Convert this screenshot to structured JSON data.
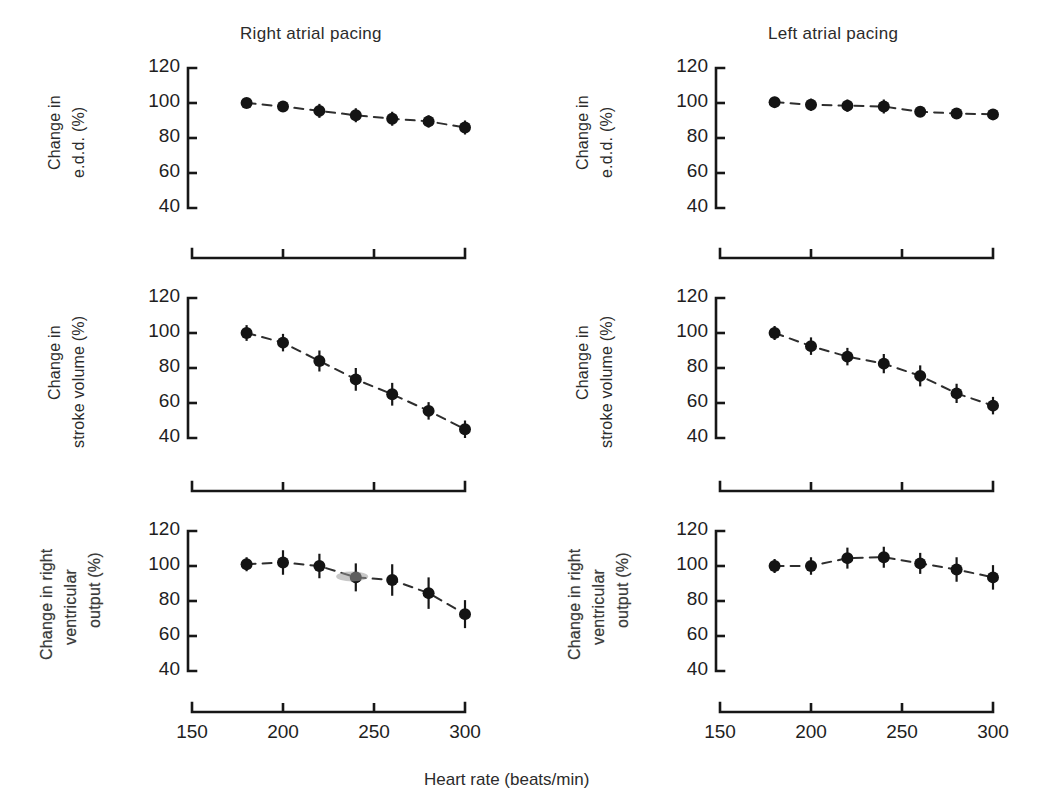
{
  "figure": {
    "column_titles": [
      "Right atrial pacing",
      "Left atrial pacing"
    ],
    "x_axis_caption": "Heart rate (beats/min)",
    "x_tick_labels": [
      "150",
      "200",
      "250",
      "300"
    ],
    "y_tick_labels": [
      "120",
      "100",
      "80",
      "60",
      "40"
    ],
    "row_y_labels": [
      [
        "Change in",
        "e.d.d. (%)"
      ],
      [
        "Change in",
        "stroke volume (%)"
      ],
      [
        "Change in right",
        "ventricular",
        "output (%)"
      ]
    ],
    "colors": {
      "ink": "#171717",
      "marker": "#141414",
      "line": "#2e2e2e",
      "text": "#2b2b2b",
      "background": "#ffffff"
    }
  },
  "chart_data": [
    {
      "type": "scatter",
      "title": "Right atrial pacing",
      "subplot": "row1-left",
      "xlabel": "Heart rate (beats/min)",
      "ylabel": "Change in e.d.d. (%)",
      "xlim": [
        150,
        300
      ],
      "ylim": [
        40,
        120
      ],
      "xticks": [
        150,
        200,
        250,
        300
      ],
      "yticks": [
        40,
        60,
        80,
        100,
        120
      ],
      "grid": false,
      "legend": "none",
      "x": [
        180,
        200,
        220,
        240,
        260,
        280,
        300
      ],
      "values": [
        100,
        98,
        95.5,
        93,
        91,
        89.5,
        86
      ],
      "errors": [
        2.5,
        3,
        4,
        4,
        4,
        3.5,
        4
      ]
    },
    {
      "type": "scatter",
      "title": "Left atrial pacing",
      "subplot": "row1-right",
      "xlabel": "Heart rate (beats/min)",
      "ylabel": "Change in e.d.d. (%)",
      "xlim": [
        150,
        300
      ],
      "ylim": [
        40,
        120
      ],
      "xticks": [
        150,
        200,
        250,
        300
      ],
      "yticks": [
        40,
        60,
        80,
        100,
        120
      ],
      "grid": false,
      "legend": "none",
      "x": [
        180,
        200,
        220,
        240,
        260,
        280,
        300
      ],
      "values": [
        100.5,
        99,
        98.5,
        98,
        95,
        94,
        93.5
      ],
      "errors": [
        3,
        3.5,
        3.5,
        4,
        3,
        3,
        3
      ]
    },
    {
      "type": "scatter",
      "title": "Right atrial pacing",
      "subplot": "row2-left",
      "xlabel": "Heart rate (beats/min)",
      "ylabel": "Change in stroke volume (%)",
      "xlim": [
        150,
        300
      ],
      "ylim": [
        40,
        120
      ],
      "xticks": [
        150,
        200,
        250,
        300
      ],
      "yticks": [
        40,
        60,
        80,
        100,
        120
      ],
      "grid": false,
      "legend": "none",
      "x": [
        180,
        200,
        220,
        240,
        260,
        280,
        300
      ],
      "values": [
        100,
        94.5,
        84,
        73.5,
        65,
        55.5,
        45
      ],
      "errors": [
        4.5,
        5,
        6,
        6.5,
        6.5,
        5,
        5
      ]
    },
    {
      "type": "scatter",
      "title": "Left atrial pacing",
      "subplot": "row2-right",
      "xlabel": "Heart rate (beats/min)",
      "ylabel": "Change in stroke volume (%)",
      "xlim": [
        150,
        300
      ],
      "ylim": [
        40,
        120
      ],
      "xticks": [
        150,
        200,
        250,
        300
      ],
      "yticks": [
        40,
        60,
        80,
        100,
        120
      ],
      "grid": false,
      "legend": "none",
      "x": [
        180,
        200,
        220,
        240,
        260,
        280,
        300
      ],
      "values": [
        100,
        92.5,
        86.5,
        82.5,
        75.5,
        65.5,
        58.5
      ],
      "errors": [
        4,
        5,
        5,
        5.5,
        6,
        5.5,
        5
      ]
    },
    {
      "type": "scatter",
      "title": "Right atrial pacing",
      "subplot": "row3-left",
      "xlabel": "Heart rate (beats/min)",
      "ylabel": "Change in right ventricular output (%)",
      "xlim": [
        150,
        300
      ],
      "ylim": [
        40,
        120
      ],
      "xticks": [
        150,
        200,
        250,
        300
      ],
      "yticks": [
        40,
        60,
        80,
        100,
        120
      ],
      "grid": false,
      "legend": "none",
      "x": [
        180,
        200,
        220,
        240,
        260,
        280,
        300
      ],
      "values": [
        101,
        102,
        100,
        93.5,
        92,
        84.5,
        72.5
      ],
      "errors": [
        4,
        7,
        7,
        8,
        9,
        9,
        8
      ]
    },
    {
      "type": "scatter",
      "title": "Left atrial pacing",
      "subplot": "row3-right",
      "xlabel": "Heart rate (beats/min)",
      "ylabel": "Change in right ventricular output (%)",
      "xlim": [
        150,
        300
      ],
      "ylim": [
        40,
        120
      ],
      "xticks": [
        150,
        200,
        250,
        300
      ],
      "yticks": [
        40,
        60,
        80,
        100,
        120
      ],
      "grid": false,
      "legend": "none",
      "x": [
        180,
        200,
        220,
        240,
        260,
        280,
        300
      ],
      "values": [
        100,
        100,
        104.5,
        105,
        101.5,
        98,
        93.5
      ],
      "errors": [
        4,
        5,
        6,
        6,
        6,
        7,
        7
      ]
    }
  ]
}
